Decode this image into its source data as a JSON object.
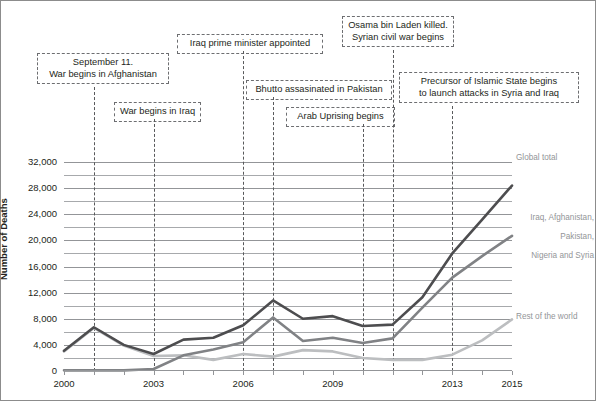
{
  "chart_data": {
    "type": "line",
    "title": "",
    "xlabel": "",
    "ylabel": "Number of Deaths",
    "x": [
      2000,
      2001,
      2002,
      2003,
      2004,
      2005,
      2006,
      2007,
      2008,
      2009,
      2010,
      2011,
      2012,
      2013,
      2014,
      2015
    ],
    "xlim": [
      2000,
      2015
    ],
    "ylim": [
      0,
      34000
    ],
    "ytick_values": [
      0,
      4000,
      8000,
      12000,
      16000,
      20000,
      24000,
      28000,
      32000
    ],
    "ytick_labels": [
      "0",
      "4,000",
      "8,000",
      "12,000",
      "16,000",
      "20,000",
      "24,000",
      "28,000",
      "32,000"
    ],
    "gridline_step": 2000,
    "grid": true,
    "xtick_values": [
      2000,
      2001,
      2002,
      2003,
      2004,
      2005,
      2006,
      2007,
      2008,
      2009,
      2010,
      2011,
      2012,
      2013,
      2014,
      2015
    ],
    "xtick_labels_shown": [
      "2000",
      "2003",
      "2006",
      "2009",
      "2013",
      "2015"
    ],
    "xtick_label_values": [
      2000,
      2003,
      2006,
      2009,
      2013,
      2015
    ],
    "legend_position": "right-of-plot (line-end labels)",
    "series": [
      {
        "name": "Global total",
        "label": "Global total",
        "color": "#4d4d4f",
        "values": [
          3100,
          6700,
          4000,
          2600,
          4800,
          5100,
          7000,
          10800,
          8000,
          8400,
          6900,
          7100,
          11300,
          18000,
          23200,
          28400
        ]
      },
      {
        "name": "Iraq, Afghanistan, Pakistan, Nigeria and Syria",
        "label": "Iraq, Afghanistan,\nPakistan,\nNigeria and Syria",
        "color": "#808285",
        "values": [
          100,
          100,
          100,
          300,
          2400,
          3300,
          4400,
          8200,
          4600,
          5100,
          4300,
          5000,
          9700,
          14300,
          17600,
          20700
        ]
      },
      {
        "name": "Rest of the world",
        "label": "Rest of the world",
        "color": "#bcbec0",
        "values": [
          3000,
          6600,
          3900,
          2300,
          2400,
          1700,
          2600,
          2200,
          3200,
          3000,
          2000,
          1700,
          1700,
          2500,
          4700,
          7900
        ]
      }
    ],
    "annotations": [
      {
        "id": "sept11",
        "text_lines": [
          "September 11.",
          "War begins in Afghanistan"
        ],
        "year": 2001
      },
      {
        "id": "iraq-war",
        "text_lines": [
          "War begins in Iraq"
        ],
        "year": 2003
      },
      {
        "id": "iraq-pm",
        "text_lines": [
          "Iraq prime minister appointed"
        ],
        "year": 2006
      },
      {
        "id": "bhutto",
        "text_lines": [
          "Bhutto assasinated in Pakistan"
        ],
        "year": 2007
      },
      {
        "id": "arab-uprising",
        "text_lines": [
          "Arab Uprising begins"
        ],
        "year": 2010
      },
      {
        "id": "osama",
        "text_lines": [
          "Osama bin Laden killed.",
          "Syrian civil war begins"
        ],
        "year": 2011
      },
      {
        "id": "isis",
        "text_lines": [
          "Precursor of Islamic State begins",
          "to launch attacks in Syria and Iraq"
        ],
        "year": 2013
      }
    ]
  },
  "axis": {
    "y_title": "Number of Deaths",
    "y_labels": [
      "32,000",
      "28,000",
      "24,000",
      "20,000",
      "16,000",
      "12,000",
      "8,000",
      "4,000",
      "0"
    ],
    "x_labels": [
      "2000",
      "2003",
      "2006",
      "2009",
      "2013",
      "2015"
    ]
  },
  "notes": {
    "sept11": {
      "line1": "September 11.",
      "line2": "War begins in Afghanistan"
    },
    "iraq_war": {
      "line1": "War begins in Iraq"
    },
    "iraq_pm": {
      "line1": "Iraq prime minister appointed"
    },
    "bhutto": {
      "line1": "Bhutto assasinated in Pakistan"
    },
    "arab_uprising": {
      "line1": "Arab Uprising begins"
    },
    "osama": {
      "line1": "Osama bin Laden killed.",
      "line2": "Syrian civil war begins"
    },
    "isis": {
      "line1": "Precursor of Islamic State begins",
      "line2": "to launch attacks in Syria and Iraq"
    }
  },
  "series_labels": {
    "global_total": "Global total",
    "five_countries_l1": "Iraq, Afghanistan,",
    "five_countries_l2": "Pakistan,",
    "five_countries_l3": "Nigeria and Syria",
    "rest_of_world": "Rest of the world"
  },
  "colors": {
    "global_total": "#4d4d4f",
    "five_countries": "#808285",
    "rest_of_world": "#bcbec0",
    "gridline": "#a7a9ac",
    "annotation_border": "#6d6e71",
    "text": "#231f20"
  }
}
